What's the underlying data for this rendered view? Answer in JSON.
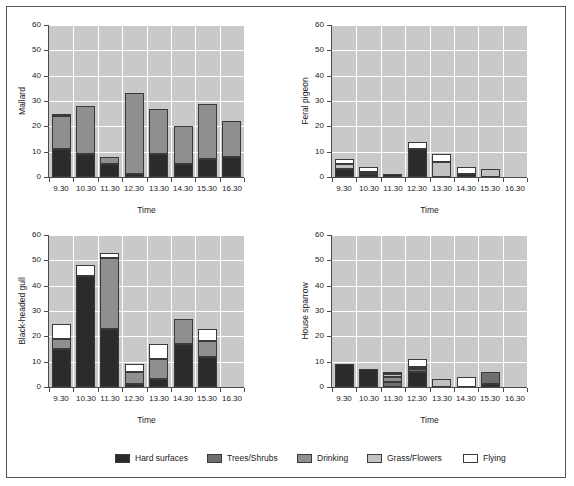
{
  "legend": {
    "items": [
      {
        "label": "Hard surfaces",
        "color": "#2b2b2b"
      },
      {
        "label": "Trees/Shrubs",
        "color": "#6e6e6e"
      },
      {
        "label": "Drinking",
        "color": "#8f8f8f"
      },
      {
        "label": "Grass/Flowers",
        "color": "#c2c2c2"
      },
      {
        "label": "Flying",
        "color": "#ffffff"
      }
    ]
  },
  "axis": {
    "ylabel_ticks": [
      "0",
      "10",
      "20",
      "30",
      "40",
      "50",
      "60"
    ],
    "xlabel": "Time",
    "categories": [
      "9.30",
      "10.30",
      "11.30",
      "12.30",
      "13.30",
      "14.30",
      "15.30",
      "16.30"
    ]
  },
  "chart_data": [
    {
      "type": "bar",
      "stacked": true,
      "title": "Mallard",
      "ylabel": "Mallard",
      "xlabel": "Time",
      "ylim": [
        0,
        60
      ],
      "yticks": [
        0,
        10,
        20,
        30,
        40,
        50,
        60
      ],
      "grid": true,
      "categories": [
        "9.30",
        "10.30",
        "11.30",
        "12.30",
        "13.30",
        "14.30",
        "15.30",
        "16.30"
      ],
      "series": [
        {
          "name": "Hard surfaces",
          "color": "#2b2b2b",
          "values": [
            11,
            9,
            5,
            1,
            9,
            5,
            7,
            8
          ]
        },
        {
          "name": "Trees/Shrubs",
          "color": "#6e6e6e",
          "values": [
            0,
            0,
            0,
            0,
            0,
            0,
            0,
            0
          ]
        },
        {
          "name": "Drinking",
          "color": "#8f8f8f",
          "values": [
            13,
            19,
            3,
            32,
            18,
            15,
            22,
            14
          ]
        },
        {
          "name": "Grass/Flowers",
          "color": "#c2c2c2",
          "values": [
            0,
            0,
            0,
            0,
            0,
            0,
            0,
            0
          ]
        },
        {
          "name": "Flying",
          "color": "#ffffff",
          "values": [
            1,
            0,
            0,
            0,
            0,
            0,
            0,
            0
          ]
        }
      ],
      "totals": [
        25,
        28,
        8,
        33,
        27,
        20,
        29,
        22
      ]
    },
    {
      "type": "bar",
      "stacked": true,
      "title": "Feral pigeon",
      "ylabel": "Feral pigeon",
      "xlabel": "Time",
      "ylim": [
        0,
        60
      ],
      "yticks": [
        0,
        10,
        20,
        30,
        40,
        50,
        60
      ],
      "grid": true,
      "categories": [
        "9.30",
        "10.30",
        "11.30",
        "12.30",
        "13.30",
        "14.30",
        "15.30",
        "16.30"
      ],
      "series": [
        {
          "name": "Hard surfaces",
          "color": "#2b2b2b",
          "values": [
            3,
            1,
            1,
            11,
            0,
            1,
            0,
            0
          ]
        },
        {
          "name": "Trees/Shrubs",
          "color": "#6e6e6e",
          "values": [
            0,
            0,
            0,
            0,
            0,
            0,
            0,
            0
          ]
        },
        {
          "name": "Drinking",
          "color": "#8f8f8f",
          "values": [
            0,
            0,
            0,
            0,
            0,
            0,
            0,
            0
          ]
        },
        {
          "name": "Grass/Flowers",
          "color": "#c2c2c2",
          "values": [
            2,
            1,
            0,
            0,
            6,
            0,
            3,
            0
          ]
        },
        {
          "name": "Flying",
          "color": "#ffffff",
          "values": [
            2,
            2,
            0,
            3,
            3,
            3,
            0,
            0
          ]
        }
      ],
      "totals": [
        7,
        4,
        1,
        14,
        9,
        4,
        3,
        0
      ]
    },
    {
      "type": "bar",
      "stacked": true,
      "title": "Black-headed gull",
      "ylabel": "Black-headed gull",
      "xlabel": "Time",
      "ylim": [
        0,
        60
      ],
      "yticks": [
        0,
        10,
        20,
        30,
        40,
        50,
        60
      ],
      "grid": true,
      "categories": [
        "9.30",
        "10.30",
        "11.30",
        "12.30",
        "13.30",
        "14.30",
        "15.30",
        "16.30"
      ],
      "series": [
        {
          "name": "Hard surfaces",
          "color": "#2b2b2b",
          "values": [
            15,
            44,
            23,
            1,
            3,
            17,
            12,
            0
          ]
        },
        {
          "name": "Trees/Shrubs",
          "color": "#6e6e6e",
          "values": [
            0,
            0,
            0,
            0,
            0,
            0,
            0,
            0
          ]
        },
        {
          "name": "Drinking",
          "color": "#8f8f8f",
          "values": [
            4,
            0,
            28,
            5,
            8,
            10,
            6,
            0
          ]
        },
        {
          "name": "Grass/Flowers",
          "color": "#c2c2c2",
          "values": [
            0,
            0,
            0,
            0,
            0,
            0,
            0,
            0
          ]
        },
        {
          "name": "Flying",
          "color": "#ffffff",
          "values": [
            6,
            4,
            2,
            3,
            6,
            0,
            5,
            0
          ]
        }
      ],
      "totals": [
        25,
        48,
        53,
        9,
        17,
        27,
        23,
        0
      ]
    },
    {
      "type": "bar",
      "stacked": true,
      "title": "House sparrow",
      "ylabel": "House sparrow",
      "xlabel": "Time",
      "ylim": [
        0,
        60
      ],
      "yticks": [
        0,
        10,
        20,
        30,
        40,
        50,
        60
      ],
      "grid": true,
      "categories": [
        "9.30",
        "10.30",
        "11.30",
        "12.30",
        "13.30",
        "14.30",
        "15.30",
        "16.30"
      ],
      "series": [
        {
          "name": "Hard surfaces",
          "color": "#2b2b2b",
          "values": [
            9,
            7,
            0,
            6,
            0,
            0,
            1,
            0
          ]
        },
        {
          "name": "Trees/Shrubs",
          "color": "#6e6e6e",
          "values": [
            0,
            0,
            2,
            1,
            0,
            0,
            5,
            0
          ]
        },
        {
          "name": "Drinking",
          "color": "#8f8f8f",
          "values": [
            0,
            0,
            2,
            1,
            0,
            0,
            0,
            0
          ]
        },
        {
          "name": "Grass/Flowers",
          "color": "#c2c2c2",
          "values": [
            0,
            0,
            1,
            0,
            3,
            0,
            0,
            0
          ]
        },
        {
          "name": "Flying",
          "color": "#ffffff",
          "values": [
            0,
            0,
            1,
            3,
            0,
            4,
            0,
            0
          ]
        }
      ],
      "totals": [
        9,
        7,
        6,
        11,
        3,
        4,
        6,
        0
      ]
    }
  ]
}
